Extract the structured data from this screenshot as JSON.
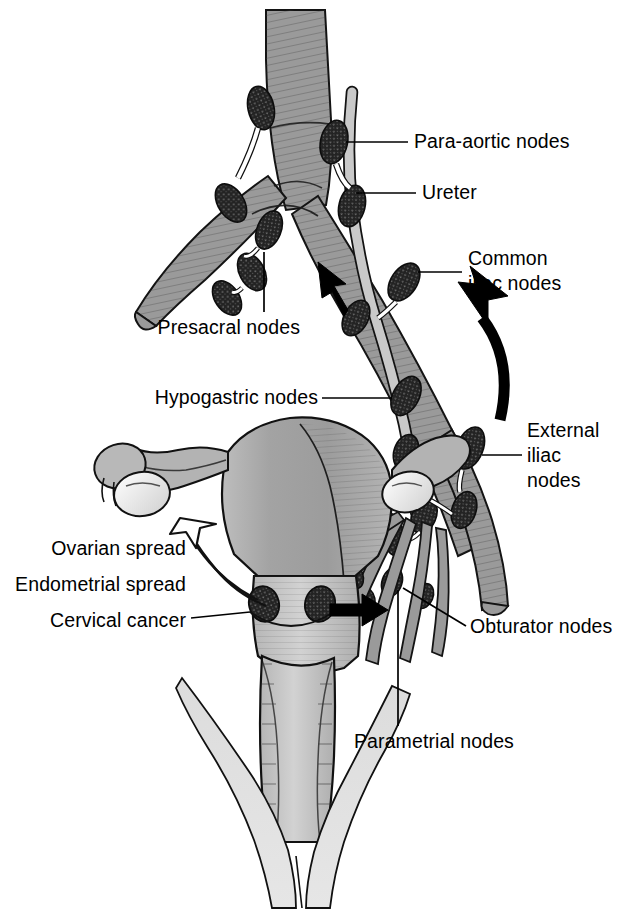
{
  "figure": {
    "type": "anatomical-illustration",
    "background_color": "#ffffff",
    "ink_color": "#000000",
    "palette": {
      "vessel_gray": "#9a9a9a",
      "vessel_dark_edge": "#111111",
      "node_dark": "#262626",
      "uterus_gray": "#a8a8a8",
      "uterus_light": "#cfcfcf",
      "ureter_pale": "#c9c9c9",
      "pelvic_floor_light": "#d8d8d8",
      "arrow_black": "#000000",
      "arrow_hollow_fill": "#ffffff"
    }
  },
  "labels": {
    "para_aortic": "Para-aortic nodes",
    "ureter": "Ureter",
    "common_iliac_line1": "Common",
    "common_iliac_line2": "iliac nodes",
    "external_iliac_line1": "External",
    "external_iliac_line2": "iliac",
    "external_iliac_line3": "nodes",
    "presacral": "Presacral nodes",
    "hypogastric": "Hypogastric nodes",
    "ovarian_spread": "Ovarian spread",
    "endometrial_spread": "Endometrial spread",
    "cervical_cancer": "Cervical cancer",
    "obturator": "Obturator nodes",
    "parametrial": "Parametrial nodes"
  },
  "structures": {
    "aorta": "abdominal aorta with bifurcation",
    "common_iliac_artery_left": "left common iliac artery",
    "common_iliac_artery_right": "right common iliac artery",
    "external_iliac_vessel": "external iliac vessel",
    "ureter": "ureter descending across iliac vessels",
    "uterus": "uterine corpus and cervix",
    "fallopian_tube": "fallopian tube with fimbriae",
    "ovary": "ovary",
    "vagina": "vagina",
    "pelvic_floor": "levator / pelvic floor musculature",
    "cervical_tumour_left": "cervical cancer lesion (left)",
    "cervical_tumour_right": "cervical cancer lesion (right)"
  },
  "node_groups": [
    {
      "name": "para-aortic nodes",
      "count": 4
    },
    {
      "name": "presacral nodes",
      "count": 3
    },
    {
      "name": "common iliac nodes",
      "count": 3
    },
    {
      "name": "external iliac nodes",
      "count": 3
    },
    {
      "name": "hypogastric nodes",
      "count": 2
    },
    {
      "name": "obturator nodes",
      "count": 3
    },
    {
      "name": "parametrial nodes",
      "count": 2
    }
  ],
  "arrows": [
    {
      "name": "ovarian-spread-arrow",
      "style": "hollow-outline",
      "direction": "up-left toward ovary"
    },
    {
      "name": "cervical-lateral-spread-arrow",
      "style": "solid-black",
      "direction": "right toward parametrium"
    },
    {
      "name": "ascending-spread-arrow",
      "style": "solid-black",
      "direction": "up-left along iliac chain"
    },
    {
      "name": "curved-ascending-arrow",
      "style": "solid-black-curved",
      "direction": "up-left sweeping from external iliac to common iliac"
    }
  ]
}
